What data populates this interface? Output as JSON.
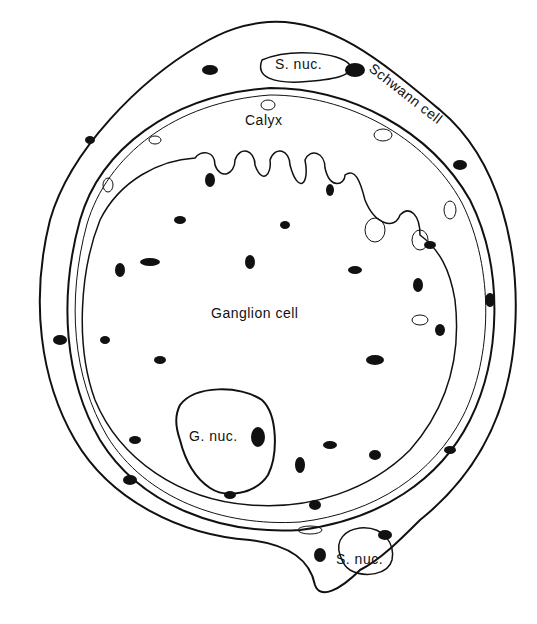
{
  "diagram": {
    "type": "histology-drawing",
    "labels": {
      "schwann_nucleus_top": "S. nuc.",
      "schwann_cell": "Schwann cell",
      "calyx": "Calyx",
      "ganglion_cell": "Ganglion cell",
      "ganglion_nucleus": "G. nuc.",
      "schwann_nucleus_bottom": "S. nuc."
    },
    "colors": {
      "ink": "#111111",
      "background": "#ffffff"
    }
  }
}
